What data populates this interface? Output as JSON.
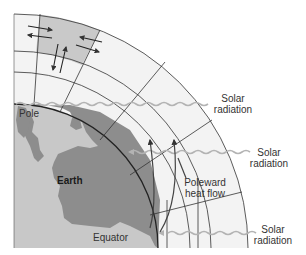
{
  "diagram": {
    "type": "atmospheric-heat-transport",
    "labels": {
      "pole": "Pole",
      "earth": "Earth",
      "equator": "Equator",
      "heat_flow_line1": "Poleward",
      "heat_flow_line2": "heat flow",
      "solar_top_line1": "Solar",
      "solar_top_line2": "radiation",
      "solar_mid_line1": "Solar",
      "solar_mid_line2": "radiation",
      "solar_bottom_line1": "Solar",
      "solar_bottom_line2": "radiation"
    },
    "colors": {
      "earth_land": "#8a8a8a",
      "earth_water": "#c4c4c4",
      "atmosphere_cell": "#f1f1f1",
      "highlight_cell": "#c9c9c9",
      "grid_line": "#333333",
      "wave": "#b5b5b5",
      "arrow": "#444444"
    }
  }
}
